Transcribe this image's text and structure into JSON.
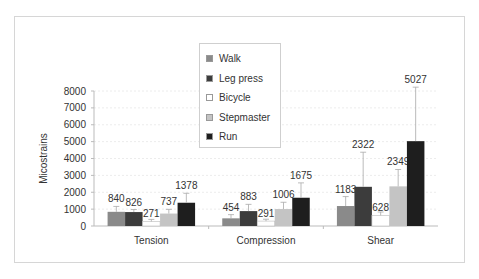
{
  "chart_data": {
    "type": "bar",
    "title": "",
    "xlabel": "",
    "ylabel": "Micostrains",
    "ylim": [
      0,
      8000
    ],
    "yticks": [
      0,
      1000,
      2000,
      3000,
      4000,
      5000,
      6000,
      7000,
      8000
    ],
    "grid": true,
    "legend_position": "top-center",
    "categories": [
      "Tension",
      "Compression",
      "Shear"
    ],
    "series": [
      {
        "name": "Walk",
        "color": "#8a8a8a",
        "values": [
          840,
          454,
          1183
        ],
        "errors": [
          320,
          220,
          560
        ]
      },
      {
        "name": "Leg press",
        "color": "#3c3c3c",
        "values": [
          826,
          883,
          2322
        ],
        "errors": [
          150,
          400,
          2050
        ]
      },
      {
        "name": "Bicycle",
        "color": "#ffffff",
        "values": [
          271,
          291,
          628
        ],
        "errors": [
          120,
          110,
          200
        ]
      },
      {
        "name": "Stepmaster",
        "color": "#c4c4c4",
        "values": [
          737,
          1006,
          2349
        ],
        "errors": [
          250,
          400,
          1000
        ]
      },
      {
        "name": "Run",
        "color": "#1e1e1e",
        "values": [
          1378,
          1675,
          5027
        ],
        "errors": [
          560,
          880,
          3200
        ]
      }
    ]
  },
  "legend": {
    "items": [
      {
        "label": "Walk",
        "color": "#8a8a8a"
      },
      {
        "label": "Leg press",
        "color": "#3c3c3c"
      },
      {
        "label": "Bicycle",
        "color": "#ffffff"
      },
      {
        "label": "Stepmaster",
        "color": "#c4c4c4"
      },
      {
        "label": "Run",
        "color": "#1e1e1e"
      }
    ]
  }
}
